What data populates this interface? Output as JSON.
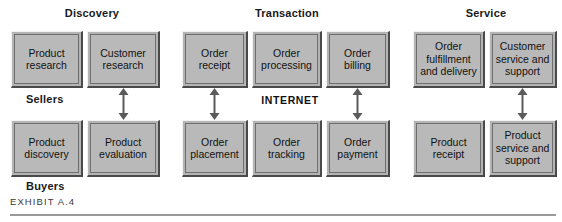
{
  "exhibit": {
    "caption": "EXHIBIT A.4"
  },
  "phases": [
    {
      "id": "discovery",
      "label": "Discovery"
    },
    {
      "id": "transaction",
      "label": "Transaction"
    },
    {
      "id": "service",
      "label": "Service"
    }
  ],
  "roles": [
    {
      "id": "sellers",
      "label": "Sellers"
    },
    {
      "id": "buyers",
      "label": "Buyers"
    }
  ],
  "network": {
    "label": "INTERNET"
  },
  "boxes": {
    "seller_row": [
      {
        "id": "product-research",
        "line1": "Product",
        "line2": "research",
        "line3": ""
      },
      {
        "id": "customer-research",
        "line1": "Customer",
        "line2": "research",
        "line3": ""
      },
      {
        "id": "order-receipt",
        "line1": "Order",
        "line2": "receipt",
        "line3": ""
      },
      {
        "id": "order-processing",
        "line1": "Order",
        "line2": "processing",
        "line3": ""
      },
      {
        "id": "order-billing",
        "line1": "Order",
        "line2": "billing",
        "line3": ""
      },
      {
        "id": "order-fulfillment",
        "line1": "Order",
        "line2": "fulfillment",
        "line3": "and delivery"
      },
      {
        "id": "customer-service",
        "line1": "Customer",
        "line2": "service and",
        "line3": "support"
      }
    ],
    "buyer_row": [
      {
        "id": "product-discovery",
        "line1": "Product",
        "line2": "discovery",
        "line3": ""
      },
      {
        "id": "product-evaluation",
        "line1": "Product",
        "line2": "evaluation",
        "line3": ""
      },
      {
        "id": "order-placement",
        "line1": "Order",
        "line2": "placement",
        "line3": ""
      },
      {
        "id": "order-tracking",
        "line1": "Order",
        "line2": "tracking",
        "line3": ""
      },
      {
        "id": "order-payment",
        "line1": "Order",
        "line2": "payment",
        "line3": ""
      },
      {
        "id": "product-receipt",
        "line1": "Product",
        "line2": "receipt",
        "line3": ""
      },
      {
        "id": "product-service",
        "line1": "Product",
        "line2": "service and",
        "line3": "support"
      }
    ]
  },
  "connectors": [
    {
      "id": "customer-research-to-product-evaluation",
      "type": "double-arrow-vertical"
    },
    {
      "id": "order-receipt-to-order-placement",
      "type": "double-arrow-vertical"
    },
    {
      "id": "order-billing-to-order-payment",
      "type": "double-arrow-vertical"
    },
    {
      "id": "customer-service-to-product-service",
      "type": "double-arrow-vertical"
    }
  ],
  "colors": {
    "box_fill": "#b9b9b9",
    "box_shadow": "#4a4a4a",
    "box_highlight": "#f2f2f2",
    "box_outline": "#6e6e6e",
    "text": "#111111",
    "rule": "#9a9a9a",
    "background": "#ffffff"
  }
}
